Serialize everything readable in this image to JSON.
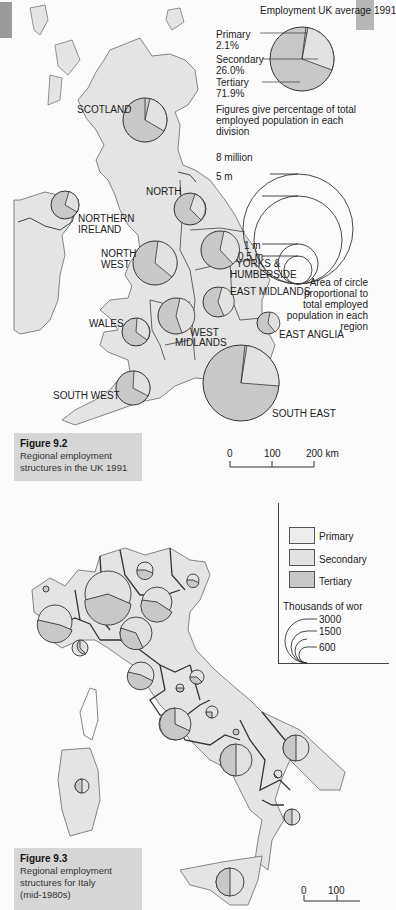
{
  "uk_map": {
    "legend": {
      "title": "Employment UK average 1991",
      "primary_label": "Primary",
      "primary_value": "2.1%",
      "secondary_label": "Secondary",
      "secondary_value": "26.0%",
      "tertiary_label": "Tertiary",
      "tertiary_value": "71.9%",
      "note": "Figures give percentage of total employed population in each division",
      "scale_8m": "8 million",
      "scale_5m": "5 m",
      "scale_1m": "1 m",
      "scale_05m": "0.5 m",
      "area_note": "Area of circle proportional to total employed population in each region"
    },
    "regions": {
      "scotland": "SCOTLAND",
      "northern_ireland_1": "NORTHERN",
      "northern_ireland_2": "IRELAND",
      "north": "NORTH",
      "north_west_1": "NORTH",
      "north_west_2": "WEST",
      "yorks_1": "YORKS &",
      "yorks_2": "HUMBERSIDE",
      "east_midlands": "EAST MIDLANDS",
      "wales": "WALES",
      "west_midlands_1": "WEST",
      "west_midlands_2": "MIDLANDS",
      "east_anglia": "EAST ANGLIA",
      "south_west": "SOUTH WEST",
      "south_east": "SOUTH EAST"
    },
    "caption": {
      "figure": "Figure 9.2",
      "text_1": "Regional employment",
      "text_2": "structures in the UK 1991"
    },
    "scale_bar": {
      "t0": "0",
      "t1": "100",
      "t2": "200 km"
    }
  },
  "italy_map": {
    "legend": {
      "primary": "Primary",
      "secondary": "Secondary",
      "tertiary": "Tertiary",
      "title": "Thousands of wor",
      "s3000": "3000",
      "s1500": "1500",
      "s600": "600"
    },
    "caption": {
      "figure": "Figure 9.3",
      "text_1": "Regional employment",
      "text_2": "structures for Italy",
      "text_3": "(mid-1980s)"
    },
    "scale_bar": {
      "t0": "0",
      "t1": "100"
    }
  },
  "colors": {
    "land": "#e4e4e4",
    "tertiary": "#c8c8c8",
    "secondary": "#e2e2e2",
    "primary": "#ededed",
    "border": "#444444",
    "caption_bg": "#d6d6d6"
  }
}
